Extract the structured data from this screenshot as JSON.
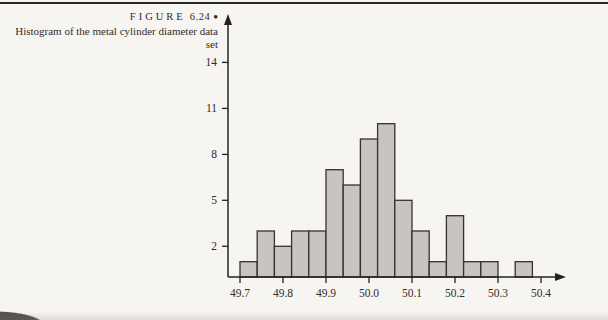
{
  "caption": {
    "figure_word": "FIGURE",
    "figure_number": "6.24",
    "bullet": "●",
    "title": "Histogram of the metal cylinder diameter data set"
  },
  "chart_data": {
    "type": "bar",
    "subtype": "histogram",
    "title": "",
    "xlabel": "",
    "ylabel": "",
    "bin_start": 49.7,
    "bin_width": 0.04,
    "values": [
      1,
      3,
      2,
      3,
      3,
      7,
      6,
      9,
      10,
      5,
      3,
      1,
      4,
      1,
      1,
      0,
      1
    ],
    "x_tick_labels": [
      "49.7",
      "49.8",
      "49.9",
      "50.0",
      "50.1",
      "50.2",
      "50.3",
      "50.4"
    ],
    "y_tick_labels": [
      "2",
      "5",
      "8",
      "11",
      "14"
    ],
    "ylim": [
      0,
      16
    ],
    "grid": false,
    "legend": false,
    "bar_fill": "#c8c5c1",
    "bar_stroke": "#36322d",
    "axis_color": "#26231f",
    "text_color": "#332c26"
  }
}
